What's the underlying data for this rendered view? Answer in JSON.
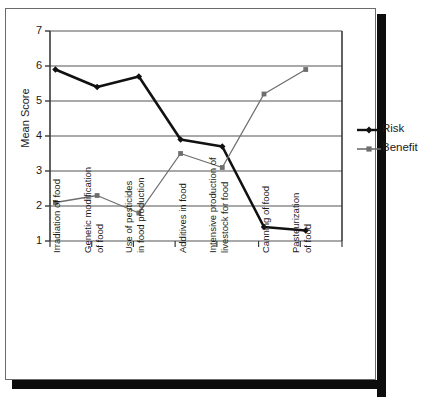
{
  "chart_data": {
    "type": "line",
    "title": "",
    "xlabel": "",
    "ylabel": "Mean Score",
    "ylim": [
      1,
      7
    ],
    "yticks": [
      1,
      2,
      3,
      4,
      5,
      6,
      7
    ],
    "grid": true,
    "legend_position": "right",
    "categories": [
      "Irradiation of food",
      "Genetic modification\nof food",
      "Use of pesticides\nin food production",
      "Additives in food",
      "Intensive production of\nlivestock for food",
      "Canning of food",
      "Pasteurization\nof food"
    ],
    "series": [
      {
        "name": "Risk",
        "color": "#111111",
        "marker": "diamond",
        "values": [
          5.9,
          5.4,
          5.7,
          3.9,
          3.7,
          1.4,
          1.3
        ]
      },
      {
        "name": "Benefit",
        "color": "#6e6e6e",
        "marker": "square",
        "values": [
          2.1,
          2.3,
          1.8,
          3.5,
          3.1,
          5.2,
          5.9
        ]
      }
    ]
  },
  "axis": {
    "y_title": "Mean Score",
    "tick_labels": [
      "7",
      "6",
      "5",
      "4",
      "3",
      "2",
      "1"
    ]
  },
  "legend": {
    "items": [
      {
        "label": "Risk"
      },
      {
        "label": "Benefit"
      }
    ]
  },
  "colors": {
    "risk": "#111111",
    "benefit": "#6e6e6e",
    "gridline": "#555555",
    "axis": "#3a3a3a",
    "frame": "#6b6b6b",
    "shadow": "#0d0d0d"
  }
}
